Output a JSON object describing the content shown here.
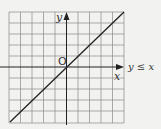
{
  "diagram": {
    "type": "coordinate-graph",
    "grid": {
      "columns": 10,
      "rows": 10
    },
    "axes": {
      "x_label": "x",
      "y_label": "y",
      "origin_label": "O"
    },
    "line": {
      "equation": "y = x",
      "label": "y ≤ x"
    },
    "colors": {
      "background": "#f2f2f0",
      "grid": "#777777",
      "axis": "#222222",
      "line": "#222222"
    }
  }
}
